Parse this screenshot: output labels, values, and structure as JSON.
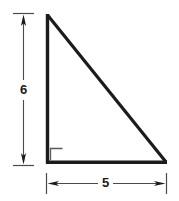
{
  "figure": {
    "name": "right-triangle-diagram",
    "background_color": "#ffffff",
    "stroke_color": "#1b1b1b",
    "dimension_line_color": "#3a3a3a",
    "shape": {
      "type": "right-triangle",
      "right_angle_vertex": "bottom-left",
      "right_angle_marker": true,
      "vertices": {
        "apex": [
          47,
          15
        ],
        "bottom_left": [
          47,
          163
        ],
        "bottom_right": [
          166,
          163
        ]
      }
    },
    "dimensions": {
      "vertical": {
        "label": "6",
        "orientation": "vertical",
        "side": "left-leg",
        "arrowheads": "both-ends",
        "extension_ticks": "both-ends"
      },
      "horizontal": {
        "label": "5",
        "orientation": "horizontal",
        "side": "bottom-leg",
        "arrowheads": "both-ends",
        "extension_ticks": "both-ends"
      }
    }
  }
}
